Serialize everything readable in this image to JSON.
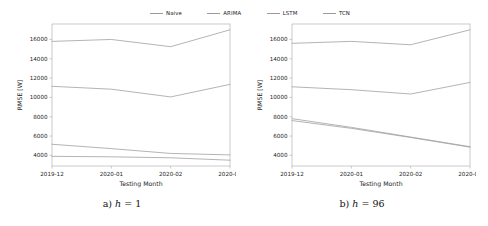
{
  "legend": {
    "position": "top-center",
    "entries": [
      {
        "label": "Naive",
        "color": "#9b9b9b"
      },
      {
        "label": "ARIMA",
        "color": "#9b9b9b"
      },
      {
        "label": "LSTM",
        "color": "#9b9b9b"
      },
      {
        "label": "TCN",
        "color": "#9b9b9b"
      }
    ]
  },
  "captions": {
    "left": {
      "prefix": "a)",
      "var": "h",
      "eq": "=",
      "value": "1"
    },
    "right": {
      "prefix": "b)",
      "var": "h",
      "eq": "=",
      "value": "96"
    }
  },
  "chart_data": [
    {
      "type": "line",
      "panel": "a",
      "title": "",
      "xlabel": "Testing Month",
      "ylabel": "RMSE [W]",
      "categories": [
        "2019-12",
        "2020-01",
        "2020-02",
        "2020-03"
      ],
      "xticklabels": [
        "2019-12",
        "2020-01",
        "2020-02",
        "2020-03"
      ],
      "yticks": [
        4000,
        6000,
        8000,
        10000,
        12000,
        14000,
        16000
      ],
      "yticklabels": [
        "4000",
        "6000",
        "8000",
        "10000",
        "12000",
        "14000",
        "16000"
      ],
      "ylim": [
        2900,
        17600
      ],
      "grid": false,
      "legend_position": "figure-top",
      "series": [
        {
          "name": "Naive",
          "color": "#9b9b9b",
          "values": [
            15800,
            16000,
            15250,
            17000
          ]
        },
        {
          "name": "ARIMA",
          "color": "#9b9b9b",
          "values": [
            11150,
            10850,
            10050,
            11350
          ]
        },
        {
          "name": "LSTM",
          "color": "#9b9b9b",
          "values": [
            5150,
            4700,
            4200,
            4050
          ]
        },
        {
          "name": "TCN",
          "color": "#9b9b9b",
          "values": [
            3900,
            3850,
            3750,
            3500
          ]
        }
      ]
    },
    {
      "type": "line",
      "panel": "b",
      "title": "",
      "xlabel": "Testing Month",
      "ylabel": "RMSE [W]",
      "categories": [
        "2019-12",
        "2020-01",
        "2020-02",
        "2020-03"
      ],
      "xticklabels": [
        "2019-12",
        "2020-01",
        "2020-02",
        "2020-03"
      ],
      "yticks": [
        4000,
        6000,
        8000,
        10000,
        12000,
        14000,
        16000
      ],
      "yticklabels": [
        "4000",
        "6000",
        "8000",
        "10000",
        "12000",
        "14000",
        "16000"
      ],
      "ylim": [
        2900,
        17600
      ],
      "grid": false,
      "legend_position": "figure-top",
      "series": [
        {
          "name": "Naive",
          "color": "#9b9b9b",
          "values": [
            15600,
            15800,
            15450,
            17000
          ]
        },
        {
          "name": "ARIMA",
          "color": "#9b9b9b",
          "values": [
            11100,
            10800,
            10350,
            11550
          ]
        },
        {
          "name": "LSTM",
          "color": "#9b9b9b",
          "values": [
            7800,
            6900,
            5900,
            4900
          ]
        },
        {
          "name": "TCN",
          "color": "#9b9b9b",
          "values": [
            7600,
            6800,
            5850,
            4850
          ]
        }
      ]
    }
  ]
}
